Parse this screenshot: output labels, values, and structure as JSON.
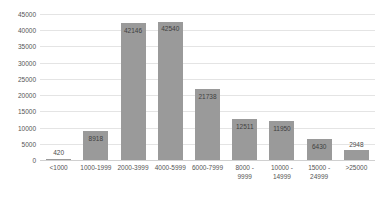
{
  "chart_data": {
    "type": "bar",
    "title": "",
    "subtitle": "",
    "xlabel": "",
    "ylabel": "",
    "categories": [
      "<1000",
      "1000-1999",
      "2000-3999",
      "4000-5999",
      "6000-7999",
      "8000 -\n9999",
      "10000 -\n14999",
      "15000 -\n24999",
      ">25000"
    ],
    "values": [
      420,
      8918,
      42146,
      42540,
      21738,
      12511,
      11950,
      6430,
      2948
    ],
    "data_labels": [
      "420",
      "8918",
      "42146",
      "42540",
      "21738",
      "12511",
      "11950",
      "6430",
      "2948"
    ],
    "ylim": [
      0,
      45000
    ],
    "ytick_values": [
      0,
      5000,
      10000,
      15000,
      20000,
      25000,
      30000,
      35000,
      40000,
      45000
    ],
    "ytick_labels": [
      "0",
      "5000",
      "10000",
      "15000",
      "20000",
      "25000",
      "30000",
      "35000",
      "40000",
      "45000"
    ],
    "grid": true,
    "legend": false,
    "legend_position": "none",
    "series": [
      {
        "name": "",
        "values": [
          420,
          8918,
          42146,
          42540,
          21738,
          12511,
          11950,
          6430,
          2948
        ]
      }
    ],
    "colors": {
      "bar": "#9a9a9a",
      "grid": "#e4e4e4",
      "baseline": "#d0d0d0",
      "text": "#555555",
      "background": "#ffffff"
    }
  }
}
